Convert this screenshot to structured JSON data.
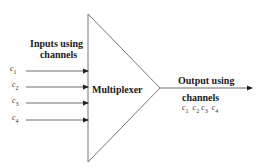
{
  "diagram": {
    "block_label": "Multiplexer",
    "inputs_label_line1": "Inputs using",
    "inputs_label_line2": "channels",
    "output_label_line1": "Output using",
    "output_label_line2": "channels",
    "inputs": [
      {
        "sym": "c",
        "sub": "1"
      },
      {
        "sym": "c",
        "sub": "2"
      },
      {
        "sym": "c",
        "sub": "3"
      },
      {
        "sym": "c",
        "sub": "4"
      }
    ],
    "outputs": [
      {
        "sym": "c",
        "sub": "1"
      },
      {
        "sym": "c",
        "sub": "2"
      },
      {
        "sym": "c",
        "sub": "3"
      },
      {
        "sym": "c",
        "sub": "4"
      }
    ],
    "colors": {
      "line": "#555555",
      "text": "#1a1a1a"
    }
  }
}
